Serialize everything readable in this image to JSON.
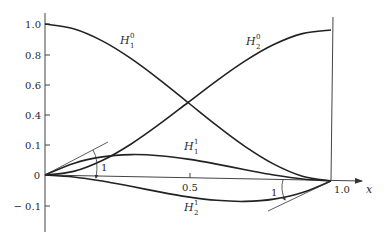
{
  "chart_data": {
    "type": "line",
    "title": "",
    "xlabel": "x",
    "ylabel": "",
    "xlim": [
      0,
      1.0
    ],
    "ylim": [
      -0.1,
      1.0
    ],
    "grid": false,
    "x_ticks": [
      "0.5",
      "1.0"
    ],
    "y_ticks": [
      "1.0",
      "0.8",
      "0.6",
      "0.4",
      "0.1",
      "0",
      "-0.1"
    ],
    "x": [
      0,
      0.1,
      0.2,
      0.3,
      0.4,
      0.5,
      0.6,
      0.7,
      0.8,
      0.9,
      1.0
    ],
    "series": [
      {
        "name": "H_1^0",
        "values": [
          1.0,
          0.972,
          0.896,
          0.784,
          0.648,
          0.5,
          0.352,
          0.216,
          0.104,
          0.028,
          0.0
        ]
      },
      {
        "name": "H_2^0",
        "values": [
          0.0,
          0.028,
          0.104,
          0.216,
          0.352,
          0.5,
          0.648,
          0.784,
          0.896,
          0.972,
          1.0
        ]
      },
      {
        "name": "H_1^1",
        "values": [
          0.0,
          0.081,
          0.128,
          0.147,
          0.144,
          0.125,
          0.096,
          0.063,
          0.032,
          0.009,
          0.0
        ]
      },
      {
        "name": "H_2^1",
        "values": [
          0.0,
          -0.009,
          -0.032,
          -0.063,
          -0.096,
          -0.125,
          -0.144,
          -0.147,
          -0.128,
          -0.081,
          0.0
        ]
      }
    ],
    "annotations": [
      {
        "text": "1",
        "note": "unit slope of H_1^1 at x = 0"
      },
      {
        "text": "1",
        "note": "unit slope of H_2^1 at x = 1"
      }
    ]
  },
  "labels": {
    "y_1_0": "1.0",
    "y_0_8": "0.8",
    "y_0_6": "0.6",
    "y_0_4": "0.4",
    "y_0_1": "0.1",
    "y_0": "0",
    "y_neg_0_1": "− 0.1",
    "x_0_5": "0.5",
    "x_1_0": "1.0",
    "x_axis": "x",
    "H": "H",
    "h10_sub": "1",
    "h10_sup": "0",
    "h20_sub": "2",
    "h20_sup": "0",
    "h11_sub": "1",
    "h11_sup": "1",
    "h21_sub": "2",
    "h21_sup": "1",
    "slope_left": "1",
    "slope_right": "1"
  }
}
